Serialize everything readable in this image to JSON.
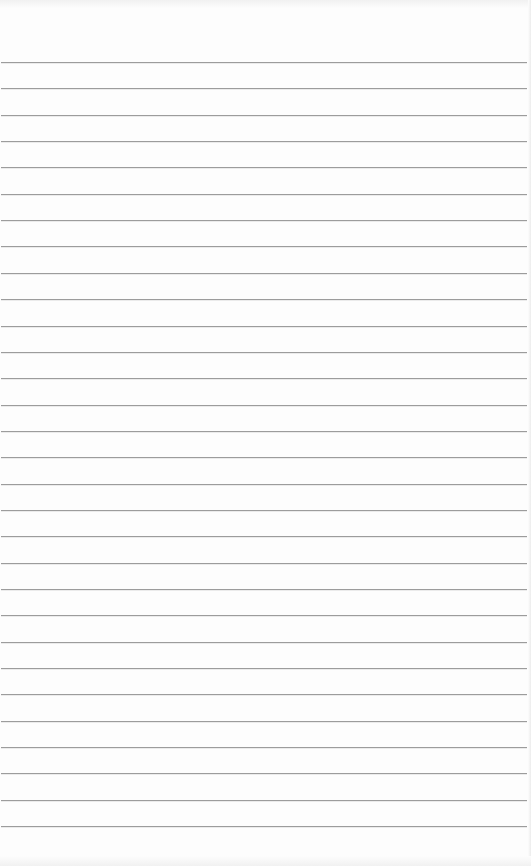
{
  "page": {
    "type": "ruled-notepad-sheet",
    "background_color": "#fdfdfd",
    "rule_color": "#9c9c9c",
    "rule_count": 30,
    "first_rule_y": 62,
    "rule_spacing": 26.35,
    "content": ""
  }
}
